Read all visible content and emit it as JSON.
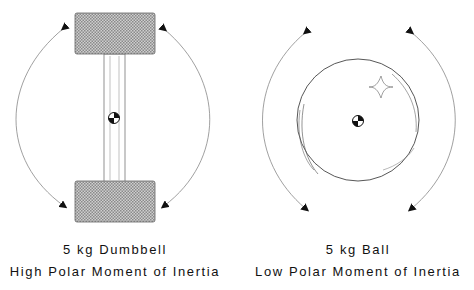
{
  "left": {
    "title": "5 kg Dumbbell",
    "subtitle": "High Polar Moment of Inertia",
    "object": "dumbbell",
    "center_of_mass_icon": "center-of-mass-icon"
  },
  "right": {
    "title": "5 kg Ball",
    "subtitle": "Low Polar Moment of Inertia",
    "object": "ball",
    "center_of_mass_icon": "center-of-mass-icon"
  },
  "colors": {
    "weight_fill": "#a8a8a8",
    "line": "#555555",
    "arrow": "#111111"
  }
}
